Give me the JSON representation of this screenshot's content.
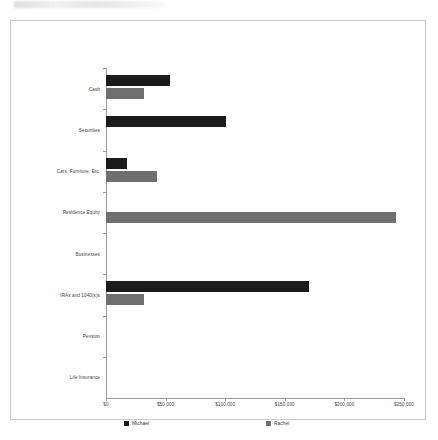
{
  "chart_data": {
    "type": "bar",
    "orientation": "horizontal",
    "title": "",
    "xlabel": "",
    "ylabel": "",
    "grid": false,
    "legend_position": "bottom",
    "categories": [
      "Cash",
      "Securities",
      "Cars, Furniture, Etc.",
      "Residence Equity",
      "Businesses",
      "IRAs and 1040(k)s",
      "Pension",
      "Life Insurance"
    ],
    "series": [
      {
        "name": "Michael",
        "color": "#1b1b1b",
        "values": [
          54000,
          101000,
          18000,
          0,
          0,
          170000,
          0,
          0
        ]
      },
      {
        "name": "Rachel",
        "color": "#6f6f6f",
        "values": [
          32000,
          0,
          43000,
          243000,
          0,
          32000,
          0,
          0
        ]
      }
    ],
    "xlim": [
      0,
      250000
    ],
    "xticks": [
      0,
      50000,
      100000,
      150000,
      200000,
      250000
    ],
    "xtick_labels": [
      "$0",
      "$50,000",
      "$100,000",
      "$150,000",
      "$200,000",
      "$250,000"
    ]
  }
}
